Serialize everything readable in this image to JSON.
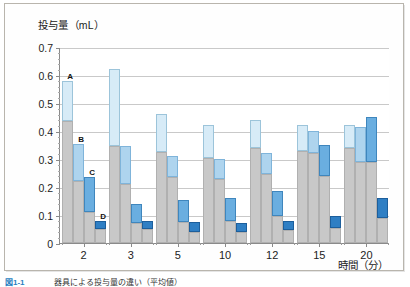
{
  "figure": {
    "y_axis_title": "投与量（mL）",
    "x_axis_title": "時間（分）",
    "caption_number": "図1-1",
    "caption_text": "器具による投与量の違い（平均値）"
  },
  "chart_data": {
    "type": "bar",
    "title": "投与量（mL）",
    "xlabel": "時間（分）",
    "ylabel": "投与量（mL）",
    "ylim": [
      0,
      0.7
    ],
    "ytick_step": 0.1,
    "ytick_labels": [
      "0",
      "0.1",
      "0.2",
      "0.3",
      "0.4",
      "0.5",
      "0.6",
      "0.7"
    ],
    "grid": true,
    "grid_axis": "y",
    "legend": "inline series labels A, B, C, D marked on first group bars",
    "categories": [
      "2",
      "3",
      "5",
      "10",
      "12",
      "15",
      "20"
    ],
    "stacked": true,
    "stack_note": "each bar has a gray lower segment and a blue upper segment; value shown is the bar total",
    "series": [
      {
        "name": "A",
        "color": "#d7ebf7",
        "base_color": "#c8c8c8",
        "totals": [
          0.58,
          0.62,
          0.46,
          0.42,
          0.44,
          0.42,
          0.42
        ],
        "base_values": [
          0.435,
          0.345,
          0.325,
          0.305,
          0.34,
          0.33,
          0.34
        ]
      },
      {
        "name": "B",
        "color": "#aed4ee",
        "base_color": "#c8c8c8",
        "totals": [
          0.355,
          0.345,
          0.31,
          0.3,
          0.32,
          0.4,
          0.415
        ],
        "base_values": [
          0.22,
          0.21,
          0.235,
          0.23,
          0.245,
          0.32,
          0.29
        ]
      },
      {
        "name": "C",
        "color": "#6aaee0",
        "base_color": "#c8c8c8",
        "totals": [
          0.235,
          0.14,
          0.155,
          0.16,
          0.185,
          0.35,
          0.45
        ],
        "base_values": [
          0.11,
          0.07,
          0.075,
          0.08,
          0.095,
          0.24,
          0.29
        ]
      },
      {
        "name": "D",
        "color": "#2f7fc4",
        "base_color": "#c8c8c8",
        "totals": [
          0.08,
          0.08,
          0.075,
          0.07,
          0.08,
          0.095,
          0.16
        ],
        "base_values": [
          0.05,
          0.05,
          0.04,
          0.04,
          0.045,
          0.055,
          0.09
        ]
      }
    ],
    "series_labels_on_first_group": [
      "A",
      "B",
      "C",
      "D"
    ]
  }
}
